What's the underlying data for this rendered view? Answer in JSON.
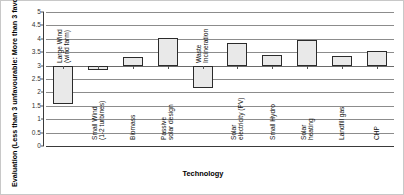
{
  "chart_data": {
    "type": "bar",
    "subtype": "floating-range-bar",
    "title": "",
    "xlabel": "Technology",
    "ylabel": "Evaluation (Less than 3 unfavourable: More than 3 favourable)",
    "ylim": [
      0,
      5
    ],
    "ytick_step": 0.5,
    "ytick_labels": [
      "5",
      "4.5",
      "4",
      "3.5",
      "3",
      "2.5",
      "2",
      "1.5",
      "1",
      "0.5",
      "0"
    ],
    "ytick_values": [
      5,
      4.5,
      4,
      3.5,
      3,
      2.5,
      2,
      1.5,
      1,
      0.5,
      0
    ],
    "grid": true,
    "legend": "none",
    "baseline": 3,
    "categories": [
      "Large Wind (wind farm)",
      "Small Wind (1-2 turbines)",
      "Biomass",
      "Passive solar design",
      "Waste Incineration",
      "Solar electricity (PV)",
      "Small Hydro",
      "Solar heating",
      "Landfill gas",
      "CHP"
    ],
    "values": [
      1.55,
      2.82,
      3.32,
      4.02,
      2.18,
      3.85,
      3.39,
      3.97,
      3.36,
      3.55
    ],
    "bars": [
      {
        "label_lines": [
          "Large Wind",
          "(wind farm)"
        ],
        "low": 1.55,
        "high": 3.0,
        "value": 1.55,
        "direction": "below",
        "label_placement": "above"
      },
      {
        "label_lines": [
          "Small Wind",
          "(1-2 turbines)"
        ],
        "low": 2.82,
        "high": 3.0,
        "value": 2.82,
        "direction": "below",
        "label_placement": "below"
      },
      {
        "label_lines": [
          "Biomass"
        ],
        "low": 3.0,
        "high": 3.32,
        "value": 3.32,
        "direction": "above",
        "label_placement": "below"
      },
      {
        "label_lines": [
          "Passive",
          "solar design"
        ],
        "low": 3.0,
        "high": 4.02,
        "value": 4.02,
        "direction": "above",
        "label_placement": "below"
      },
      {
        "label_lines": [
          "Waste",
          "Incineration"
        ],
        "low": 2.18,
        "high": 3.0,
        "value": 2.18,
        "direction": "below",
        "label_placement": "above"
      },
      {
        "label_lines": [
          "Solar",
          "electricity (PV)"
        ],
        "low": 3.0,
        "high": 3.85,
        "value": 3.85,
        "direction": "above",
        "label_placement": "below"
      },
      {
        "label_lines": [
          "Small Hydro"
        ],
        "low": 3.0,
        "high": 3.39,
        "value": 3.39,
        "direction": "above",
        "label_placement": "below"
      },
      {
        "label_lines": [
          "Solar",
          "heating"
        ],
        "low": 3.0,
        "high": 3.97,
        "value": 3.97,
        "direction": "above",
        "label_placement": "below"
      },
      {
        "label_lines": [
          "Landfill gas"
        ],
        "low": 3.0,
        "high": 3.36,
        "value": 3.36,
        "direction": "above",
        "label_placement": "below"
      },
      {
        "label_lines": [
          "CHP"
        ],
        "low": 3.0,
        "high": 3.55,
        "value": 3.55,
        "direction": "above",
        "label_placement": "below"
      }
    ],
    "colors": {
      "bar_fill": "#e9e9e9",
      "bar_border": "#2b2b2b",
      "gridline": "#8c8c8c",
      "axis": "#3a3a3a",
      "text": "#111111",
      "background": "#ffffff"
    }
  }
}
